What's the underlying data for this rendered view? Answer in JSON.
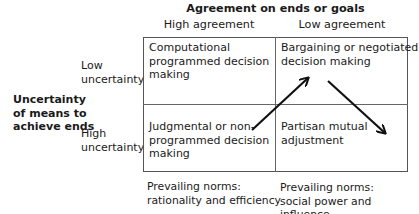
{
  "diagram": {
    "title": "Agreement on ends or goals",
    "columns": [
      "High agreement",
      "Low agreement"
    ],
    "rows": [
      {
        "label_line1": "Low",
        "label_line2": "uncertainty"
      },
      {
        "label_line1": "High",
        "label_line2": "uncertainty"
      }
    ],
    "row_axis_label": [
      "Uncertainty",
      "of means to",
      "achieve ends"
    ],
    "cells": {
      "low_unc_high_agr": [
        "Computational",
        "programmed decision",
        "making"
      ],
      "low_unc_low_agr": [
        "Bargaining or negotiated",
        "decision making"
      ],
      "high_unc_high_agr": [
        "Judgmental or non-",
        "programmed decision",
        "making"
      ],
      "high_unc_low_agr": [
        "Partisan mutual",
        "adjustment"
      ]
    },
    "norms": {
      "high_agreement": [
        "Prevailing norms:",
        "rationality and efficiency"
      ],
      "low_agreement": [
        "Prevailing norms:",
        "social power and influence"
      ]
    },
    "arrows": [
      {
        "from": "Judgmental or non-programmed decision making",
        "to": "Bargaining or negotiated decision making"
      },
      {
        "from": "Bargaining or negotiated decision making",
        "to": "Partisan mutual adjustment"
      }
    ],
    "colors": {
      "text": "#1a1a1a",
      "lines": "#555555",
      "arrow": "#111111"
    }
  }
}
